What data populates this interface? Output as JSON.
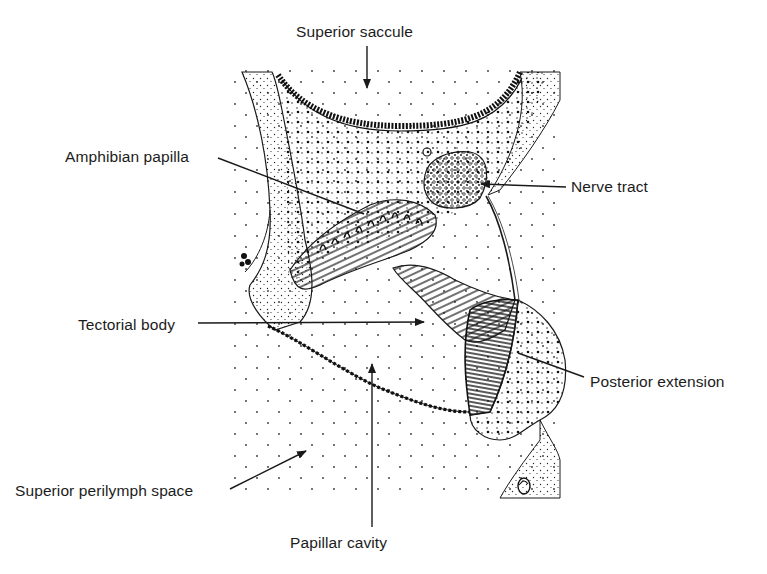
{
  "figure": {
    "labels": [
      {
        "id": "superior-saccule",
        "text": "Superior saccule",
        "pointer": "arrow-down"
      },
      {
        "id": "amphibian-papilla",
        "text": "Amphibian papilla",
        "pointer": "line"
      },
      {
        "id": "nerve-tract",
        "text": "Nerve tract",
        "pointer": "arrow-left"
      },
      {
        "id": "tectorial-body",
        "text": "Tectorial body",
        "pointer": "arrow-right"
      },
      {
        "id": "posterior-extension",
        "text": "Posterior extension",
        "pointer": "line"
      },
      {
        "id": "superior-perilymph-space",
        "text": "Superior perilymph space",
        "pointer": "arrow-up-right"
      },
      {
        "id": "papillar-cavity",
        "text": "Papillar cavity",
        "pointer": "arrow-up"
      }
    ]
  },
  "colors": {
    "ink": "#1a1a1a",
    "background": "#ffffff"
  }
}
